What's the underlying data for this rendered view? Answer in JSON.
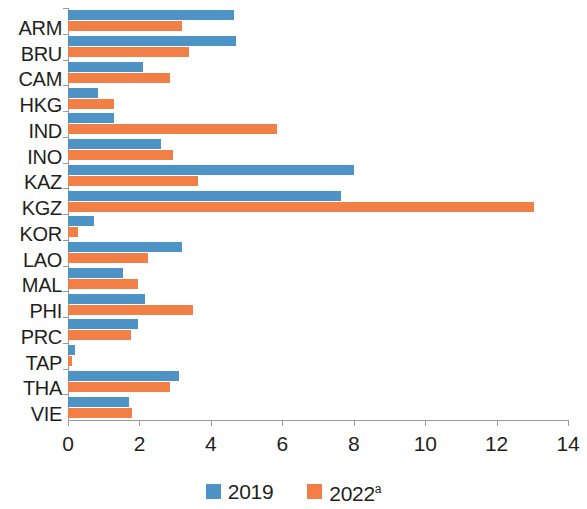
{
  "chart_data": {
    "type": "bar",
    "orientation": "horizontal",
    "title": "",
    "subtitle": "",
    "xlabel": "",
    "ylabel": "",
    "xlim": [
      0,
      14
    ],
    "xticks": [
      0,
      2,
      4,
      6,
      8,
      10,
      12,
      14
    ],
    "xtick_labels": [
      "0",
      "2",
      "4",
      "6",
      "8",
      "10",
      "12",
      "14"
    ],
    "grid": false,
    "legend_position": "bottom-center",
    "categories": [
      "ARM",
      "BRU",
      "CAM",
      "HKG",
      "IND",
      "INO",
      "KAZ",
      "KGZ",
      "KOR",
      "LAO",
      "MAL",
      "PHI",
      "PRC",
      "TAP",
      "THA",
      "VIE"
    ],
    "series": [
      {
        "name": "2019",
        "color": "#4e93c6",
        "values": [
          4.65,
          4.7,
          2.1,
          0.85,
          1.3,
          2.6,
          8.0,
          7.65,
          0.72,
          3.2,
          1.55,
          2.15,
          1.95,
          0.2,
          3.1,
          1.7
        ]
      },
      {
        "name": "2022",
        "name_superscript": "a",
        "color": "#f27f45",
        "values": [
          3.2,
          3.4,
          2.85,
          1.3,
          5.85,
          2.95,
          3.65,
          13.05,
          0.28,
          2.25,
          1.95,
          3.5,
          1.75,
          0.12,
          2.85,
          1.8
        ]
      }
    ],
    "legend": [
      {
        "label": "2019",
        "superscript": "",
        "color": "#4e93c6"
      },
      {
        "label": "2022",
        "superscript": "a",
        "color": "#f27f45"
      }
    ]
  }
}
